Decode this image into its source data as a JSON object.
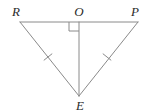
{
  "figure": {
    "type": "geometry-diagram",
    "width": 149,
    "height": 112,
    "background_color": "#ffffff",
    "stroke_color": "#8a8a8a",
    "label_color": "#2b2b2b",
    "stroke_width": 1
  },
  "points": {
    "R": {
      "label": "R",
      "x": 20,
      "y": 22,
      "label_x": 16,
      "label_y": 11
    },
    "O": {
      "label": "O",
      "x": 79,
      "y": 22,
      "label_x": 79,
      "label_y": 11
    },
    "P": {
      "label": "P",
      "x": 138,
      "y": 22,
      "label_x": 135,
      "label_y": 11
    },
    "E": {
      "label": "E",
      "x": 79,
      "y": 96,
      "label_x": 80,
      "label_y": 105
    }
  },
  "segments": [
    {
      "name": "RP",
      "from": "R",
      "to": "P",
      "x1": 20,
      "y1": 22,
      "x2": 138,
      "y2": 22
    },
    {
      "name": "RE",
      "from": "R",
      "to": "E",
      "x1": 20,
      "y1": 22,
      "x2": 79,
      "y2": 96
    },
    {
      "name": "PE",
      "from": "P",
      "to": "E",
      "x1": 138,
      "y1": 22,
      "x2": 79,
      "y2": 96
    },
    {
      "name": "OE",
      "from": "O",
      "to": "E",
      "x1": 79,
      "y1": 22,
      "x2": 79,
      "y2": 96
    }
  ],
  "right_angle": {
    "name": "right-angle-at-O",
    "vertex": "O",
    "path": "M 69 22 L 69 31 L 79 31",
    "size": 10
  },
  "tick_marks": [
    {
      "name": "congruence-tick-RE",
      "on_segment": "RE",
      "cx": 48,
      "cy": 57,
      "x1": 44.1,
      "y1": 60.1,
      "x2": 51.9,
      "y2": 53.9
    },
    {
      "name": "congruence-tick-PE",
      "on_segment": "PE",
      "cx": 107,
      "cy": 57,
      "x1": 103.1,
      "y1": 53.9,
      "x2": 110.9,
      "y2": 60.1
    }
  ],
  "labels": [
    {
      "key": "R",
      "text": "R"
    },
    {
      "key": "O",
      "text": "O"
    },
    {
      "key": "P",
      "text": "P"
    },
    {
      "key": "E",
      "text": "E"
    }
  ]
}
